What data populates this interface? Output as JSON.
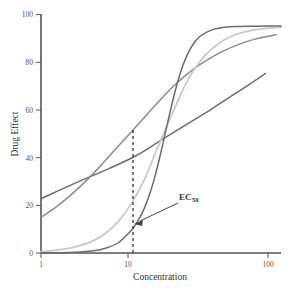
{
  "chart_data": {
    "type": "line",
    "title": "",
    "xlabel": "Concentration",
    "ylabel": "Drug Effect",
    "xscale": "log",
    "xlim": [
      1,
      130
    ],
    "ylim": [
      0,
      100
    ],
    "xticks": [
      1,
      10,
      100
    ],
    "xtick_labels": [
      "1",
      "10",
      "100"
    ],
    "yticks": [
      0,
      20,
      40,
      60,
      80,
      100
    ],
    "ytick_labels": [
      "0",
      "20",
      "40",
      "60",
      "80",
      "100"
    ],
    "grid": false,
    "legend": "none",
    "ec50": 12,
    "ec50_effect": 50,
    "annotations": [
      {
        "name": "ec50-annotation",
        "text": "EC",
        "subscript": "50",
        "points_to_x": 12,
        "points_to_y": 13
      }
    ],
    "series": [
      {
        "name": "hill-slope-5",
        "hill": 5,
        "color": "#6b6b6b",
        "x": [
          1,
          1.3,
          1.7,
          2.2,
          2.9,
          3.7,
          4.8,
          6.2,
          7.0,
          8.0,
          9.0,
          10.0,
          11.0,
          12.0,
          13.0,
          14.5,
          16,
          18,
          21,
          25,
          32,
          42,
          56,
          75,
          100,
          130
        ],
        "y": [
          0.0,
          0.1,
          0.2,
          0.4,
          0.9,
          2.0,
          4.3,
          9.3,
          12.8,
          18.0,
          24.3,
          31.5,
          39.2,
          47.0,
          54.4,
          64.0,
          71.8,
          79.4,
          86.3,
          90.8,
          93.6,
          94.7,
          95.0,
          95.1,
          95.2,
          95.2
        ]
      },
      {
        "name": "hill-slope-2",
        "hill": 2,
        "color": "#c9c9c9",
        "x": [
          1,
          1.3,
          1.7,
          2.2,
          2.9,
          3.7,
          4.8,
          6.2,
          8.0,
          10.0,
          12.0,
          14.5,
          18,
          22,
          28,
          36,
          46,
          60,
          78,
          100,
          130
        ],
        "y": [
          0.6,
          1.1,
          1.8,
          3.1,
          5.2,
          8.3,
          13.3,
          20.4,
          30.0,
          41.0,
          50.0,
          59.0,
          69.0,
          76.5,
          83.0,
          87.6,
          90.6,
          92.5,
          93.7,
          94.3,
          94.7
        ]
      },
      {
        "name": "hill-slope-1",
        "hill": 1,
        "color": "#8c8c8c",
        "x": [
          1,
          1.4,
          1.9,
          2.6,
          3.5,
          4.7,
          6.3,
          8.5,
          11,
          14,
          18,
          24,
          32,
          42,
          56,
          74,
          95,
          118
        ],
        "y": [
          15.0,
          19.8,
          25.0,
          31.1,
          37.6,
          44.4,
          51.0,
          57.9,
          63.8,
          69.0,
          73.8,
          78.4,
          82.2,
          85.1,
          87.6,
          89.5,
          90.7,
          91.6
        ]
      },
      {
        "name": "hill-slope-0-5",
        "hill": 0.5,
        "color": "#6e6e6e",
        "x": [
          1,
          2,
          4,
          7,
          12,
          20,
          32,
          50,
          75,
          95
        ],
        "y": [
          22.8,
          29.3,
          35.5,
          41.0,
          48.0,
          54.5,
          60.5,
          66.5,
          72.0,
          75.3
        ]
      }
    ]
  }
}
